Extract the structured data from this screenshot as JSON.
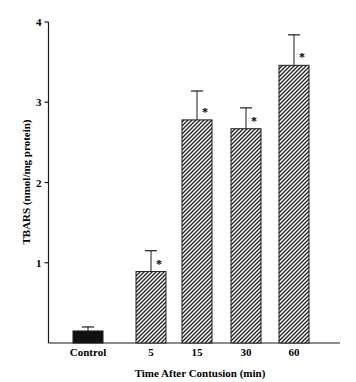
{
  "chart_data": {
    "type": "bar",
    "title": "",
    "xlabel": "Time After Contusion (min)",
    "ylabel": "TBARS (nmol/mg protein)",
    "ylim": [
      0,
      4
    ],
    "yticks": [
      1,
      2,
      3,
      4
    ],
    "grid": false,
    "legend": null,
    "categories": [
      "Control",
      "5",
      "15",
      "30",
      "60"
    ],
    "values": [
      0.15,
      0.89,
      2.78,
      2.67,
      3.46
    ],
    "error_upper": [
      0.05,
      0.26,
      0.36,
      0.26,
      0.38
    ],
    "significance": [
      "",
      "*",
      "*",
      "*",
      "*"
    ],
    "fills": [
      "solid",
      "hatched",
      "hatched",
      "hatched",
      "hatched"
    ]
  },
  "colors": {
    "axis": "#1a1a1a",
    "solid_bar": "#111111",
    "hatch": "#222222",
    "background": "#ffffff"
  }
}
